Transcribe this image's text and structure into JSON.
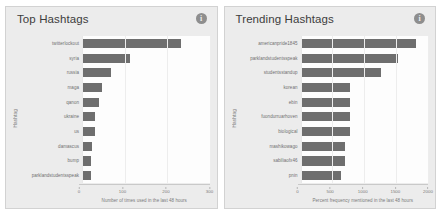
{
  "panels": [
    {
      "title": "Top Hashtags",
      "info_icon": "info-icon",
      "chart_data": {
        "type": "bar",
        "orientation": "horizontal",
        "title": "Top Hashtags",
        "xlabel": "Number of times used in the last 48 hours",
        "ylabel": "Hashtag",
        "xlim": [
          0,
          300
        ],
        "xticks": [
          0,
          100,
          200,
          300
        ],
        "grid": true,
        "bar_color": "#6e6e6e",
        "categories": [
          "twitterlockout",
          "syria",
          "russia",
          "maga",
          "qanon",
          "ukraine",
          "us",
          "damascus",
          "bump",
          "parklandstudentsspeak"
        ],
        "values": [
          232,
          113,
          68,
          47,
          39,
          31,
          30,
          23,
          22,
          22
        ]
      }
    },
    {
      "title": "Trending Hashtags",
      "info_icon": "info-icon",
      "chart_data": {
        "type": "bar",
        "orientation": "horizontal",
        "title": "Trending Hashtags",
        "xlabel": "Percent frequency mentioned in the last 48 hours",
        "ylabel": "Hashtag",
        "xlim": [
          0,
          2000
        ],
        "xticks": [
          0,
          500,
          1000,
          1500,
          2000
        ],
        "grid": true,
        "bar_color": "#6e6e6e",
        "categories": [
          "americanpride1845",
          "parklandstudentsspeak",
          "studentsstandup",
          "korean",
          "ebin",
          "fuondurruarhoven",
          "biological",
          "mashikowago",
          "sabiliaofx46",
          "pnin"
        ],
        "values": [
          1805,
          1525,
          1270,
          770,
          770,
          775,
          775,
          700,
          700,
          640
        ]
      }
    }
  ]
}
